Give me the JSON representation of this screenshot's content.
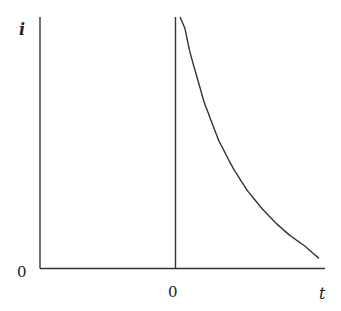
{
  "chart_data": {
    "type": "line",
    "title": "",
    "xlabel": "t",
    "ylabel": "i",
    "x_ticks": [
      {
        "label": "0",
        "position": "at vertical line (t = 0)"
      }
    ],
    "y_ticks": [
      {
        "label": "0",
        "position": "at horizontal axis"
      }
    ],
    "grid": false,
    "legend": null,
    "series": [
      {
        "name": "current i(t)",
        "description": "Decaying curve starting near infinity just after t = 0 and falling toward zero as t increases",
        "x": [
          0.05,
          0.1,
          0.2,
          0.3,
          0.4,
          0.5,
          0.6,
          0.7,
          0.8,
          0.9,
          1.0
        ],
        "y": [
          1.0,
          0.86,
          0.66,
          0.51,
          0.4,
          0.31,
          0.24,
          0.18,
          0.13,
          0.09,
          0.04
        ]
      }
    ],
    "annotations": [
      "vertical line at t = 0"
    ],
    "xlim": [
      -1,
      1.05
    ],
    "ylim": [
      0,
      1
    ]
  },
  "labels": {
    "y_axis": "i",
    "x_axis": "t",
    "y_zero": "0",
    "x_zero": "0"
  },
  "colors": {
    "axis": "#333333",
    "curve": "#333333"
  }
}
